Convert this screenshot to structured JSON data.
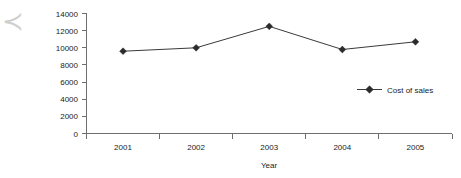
{
  "chart_data": {
    "type": "line",
    "title": "",
    "subtitle": "",
    "xlabel": "Year",
    "ylabel": "",
    "categories": [
      "2001",
      "2002",
      "2003",
      "2004",
      "2005"
    ],
    "series": [
      {
        "name": "Cost of sales",
        "values": [
          9600,
          10000,
          12500,
          9800,
          10700
        ],
        "color": "#2b2b2b",
        "marker": "diamond"
      }
    ],
    "ylim": [
      0,
      14000
    ],
    "yticks": [
      0,
      2000,
      4000,
      6000,
      8000,
      10000,
      12000,
      14000
    ],
    "ytick_labels": [
      "0",
      "2000",
      "4000",
      "6000",
      "8000",
      "10000",
      "12000",
      "14000"
    ],
    "xtick_labels": [
      "2001",
      "2002",
      "2003",
      "2004",
      "2005"
    ],
    "grid": false,
    "legend": {
      "position": "inside-right",
      "entries": [
        "Cost of sales"
      ]
    }
  },
  "axes": {
    "y_axis_name": "value-axis",
    "x_axis_name": "category-axis",
    "x_title": "Year"
  },
  "legend": {
    "entry_label": "Cost of sales"
  },
  "artifact": {
    "glyph": "≺"
  }
}
